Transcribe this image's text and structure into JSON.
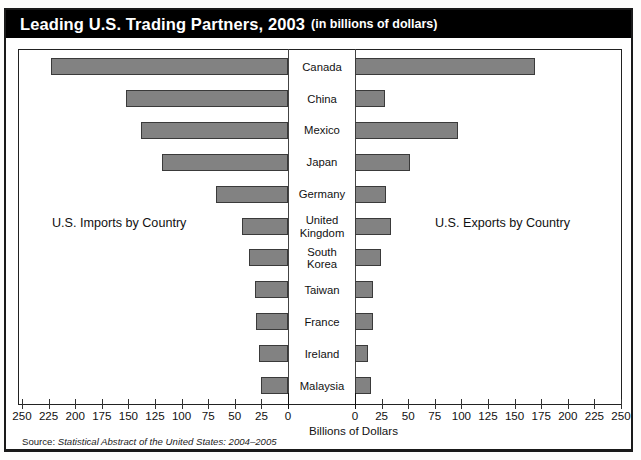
{
  "title": {
    "main": "Leading U.S. Trading Partners, 2003",
    "sub": "(in billions of dollars)"
  },
  "captions": {
    "imports": "U.S. Imports by Country",
    "exports": "U.S. Exports by Country"
  },
  "axis": {
    "title": "Billions of Dollars",
    "left_ticks": [
      "250",
      "225",
      "200",
      "175",
      "150",
      "125",
      "100",
      "75",
      "50",
      "25",
      "0"
    ],
    "right_ticks": [
      "0",
      "25",
      "50",
      "75",
      "100",
      "125",
      "150",
      "175",
      "200",
      "225",
      "250"
    ],
    "max": 250
  },
  "source": {
    "prefix": "Source: ",
    "italic": "Statistical Abstract of the United States: 2004–2005"
  },
  "colors": {
    "bar_fill": "#828282",
    "bar_border": "#3a3a3a",
    "title_band": "#000000",
    "frame": "#1a1a1a"
  },
  "chart_data": {
    "type": "bar",
    "title": "Leading U.S. Trading Partners, 2003 (in billions of dollars)",
    "xlabel": "Billions of Dollars",
    "ylabel": "",
    "orientation": "horizontal",
    "layout": "bidirectional-population-pyramid",
    "grid": false,
    "legend": "side-captions",
    "xlim": [
      0,
      250
    ],
    "categories": [
      "Canada",
      "China",
      "Mexico",
      "Japan",
      "Germany",
      "United Kingdom",
      "South Korea",
      "Taiwan",
      "France",
      "Ireland",
      "Malaysia"
    ],
    "category_lines": [
      [
        "Canada"
      ],
      [
        "China"
      ],
      [
        "Mexico"
      ],
      [
        "Japan"
      ],
      [
        "Germany"
      ],
      [
        "United",
        "Kingdom"
      ],
      [
        "South",
        "Korea"
      ],
      [
        "Taiwan"
      ],
      [
        "France"
      ],
      [
        "Ireland"
      ],
      [
        "Malaysia"
      ]
    ],
    "series": [
      {
        "name": "U.S. Imports by Country",
        "side": "left",
        "values": [
          223,
          152,
          138,
          118,
          68,
          43,
          37,
          31,
          30,
          27,
          25
        ]
      },
      {
        "name": "U.S. Exports by Country",
        "side": "right",
        "values": [
          169,
          28,
          97,
          52,
          29,
          34,
          24,
          17,
          17,
          12,
          15
        ]
      }
    ]
  }
}
